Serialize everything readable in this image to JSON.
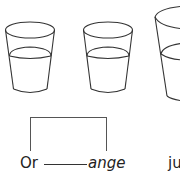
{
  "illustration": {
    "cups": [
      {
        "name": "cup-1",
        "fill": "half"
      },
      {
        "name": "cup-2",
        "fill": "half"
      },
      {
        "name": "cup-3",
        "fill": "half",
        "cropped": true
      }
    ]
  },
  "word": {
    "first_part": "Or",
    "second_part": "ange",
    "next_word": "ju"
  },
  "colors": {
    "line": "#333333",
    "background": "#ffffff"
  }
}
